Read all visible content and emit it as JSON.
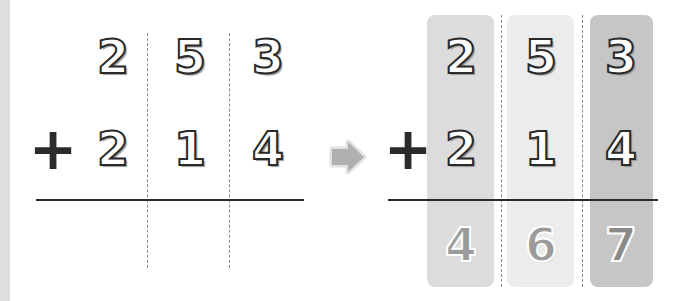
{
  "left_problem": {
    "operator": "+",
    "addend_top": [
      "2",
      "5",
      "3"
    ],
    "addend_bottom": [
      "2",
      "1",
      "4"
    ],
    "result": [
      "",
      "",
      ""
    ]
  },
  "arrow": {
    "icon": "right-arrow-icon",
    "color": "#b0b0b0"
  },
  "right_problem": {
    "operator": "+",
    "addend_top": [
      "2",
      "5",
      "3"
    ],
    "addend_bottom": [
      "2",
      "1",
      "4"
    ],
    "result": [
      "4",
      "6",
      "7"
    ],
    "column_colors": [
      "#dcdcdc",
      "#ececec",
      "#c6c6c6"
    ]
  },
  "colors": {
    "side_strip": "#dedede",
    "line": "#2b2b2b",
    "dashed": "#8a8a8a"
  }
}
